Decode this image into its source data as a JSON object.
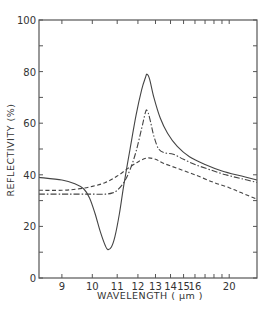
{
  "chart_data": {
    "type": "line",
    "title": "",
    "xlabel": "WAVELENGTH ( μm )",
    "ylabel": "REFLECTIVITY (%)",
    "x_scale": "reciprocal",
    "xlim": [
      8.37,
      25.1
    ],
    "ylim": [
      0,
      100
    ],
    "grid": false,
    "legend": "none",
    "x_ticks": [
      9,
      10,
      11,
      12,
      13,
      14,
      15,
      16,
      17,
      18,
      19,
      20
    ],
    "x_tick_labels": [
      "9",
      "10",
      "11",
      "12",
      "13",
      "14",
      "15",
      "16",
      "",
      "",
      "",
      "20"
    ],
    "y_ticks": [
      0,
      10,
      20,
      30,
      40,
      50,
      60,
      70,
      80,
      90,
      100
    ],
    "y_tick_labels": [
      "0",
      "",
      "20",
      "",
      "40",
      "",
      "60",
      "",
      "80",
      "",
      "100"
    ],
    "series": [
      {
        "name": "solid",
        "style": "solid",
        "x": [
          8.37,
          9.0,
          9.4,
          9.7,
          9.9,
          10.1,
          10.3,
          10.5,
          10.6,
          10.75,
          10.9,
          11.1,
          11.3,
          11.6,
          11.9,
          12.2,
          12.4,
          12.5,
          12.65,
          12.9,
          13.3,
          13.8,
          14.5,
          15.5,
          17.0,
          19.0,
          22.0,
          25.1
        ],
        "y": [
          39,
          38,
          36.5,
          34.5,
          31,
          25,
          18,
          12.5,
          11,
          12,
          16,
          25,
          36,
          50,
          63,
          73,
          77.5,
          79,
          77,
          70,
          62,
          56,
          51,
          47,
          44,
          41.5,
          39.5,
          38
        ]
      },
      {
        "name": "dash-dot",
        "style": "dashdot",
        "x": [
          8.37,
          9.0,
          9.5,
          10.0,
          10.5,
          10.8,
          11.0,
          11.3,
          11.6,
          11.9,
          12.2,
          12.4,
          12.5,
          12.65,
          12.9,
          13.2,
          13.6,
          14.2,
          15.0,
          16.0,
          17.5,
          19.5,
          22.0,
          25.1
        ],
        "y": [
          32.5,
          32.5,
          32.5,
          32.5,
          32.5,
          33,
          34,
          37,
          42,
          49,
          58,
          64,
          65,
          62,
          55,
          50,
          48.5,
          48,
          46,
          44,
          42,
          40,
          38.5,
          37
        ]
      },
      {
        "name": "dashed",
        "style": "dashed",
        "x": [
          8.37,
          9.0,
          9.5,
          10.0,
          10.5,
          11.0,
          11.5,
          12.0,
          12.5,
          13.0,
          13.5,
          14.5,
          16.0,
          18.0,
          20.0,
          22.0,
          25.1
        ],
        "y": [
          34,
          34,
          34.5,
          35.5,
          37,
          39.5,
          42.5,
          45,
          46.5,
          46,
          44.5,
          42.5,
          40,
          37,
          35,
          33,
          30.5
        ]
      }
    ]
  }
}
